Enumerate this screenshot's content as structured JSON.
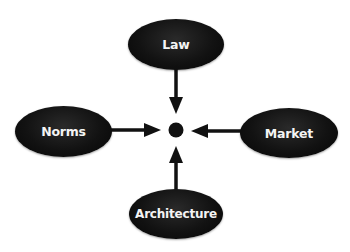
{
  "diagram": {
    "type": "regulation-modalities",
    "center": {
      "label": "",
      "shape": "dot",
      "color": "#111111"
    },
    "nodes": [
      {
        "id": "law",
        "label": "Law",
        "position": "top"
      },
      {
        "id": "norms",
        "label": "Norms",
        "position": "left"
      },
      {
        "id": "market",
        "label": "Market",
        "position": "right"
      },
      {
        "id": "architecture",
        "label": "Architecture",
        "position": "bottom"
      }
    ],
    "edges": [
      {
        "from": "law",
        "to": "center",
        "direction": "down"
      },
      {
        "from": "norms",
        "to": "center",
        "direction": "right"
      },
      {
        "from": "market",
        "to": "center",
        "direction": "left"
      },
      {
        "from": "architecture",
        "to": "center",
        "direction": "up"
      }
    ],
    "colors": {
      "node_fill": "#111111",
      "node_text": "#ffffff",
      "arrow": "#111111",
      "background": "#ffffff"
    }
  }
}
